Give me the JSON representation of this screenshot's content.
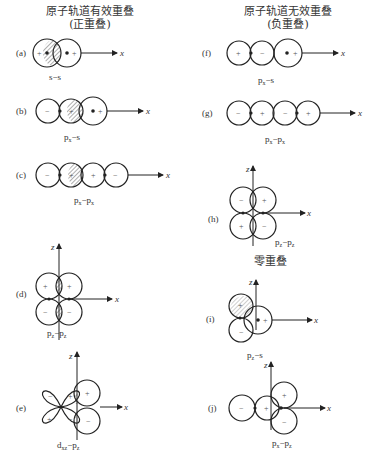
{
  "headings": {
    "left_title": "原子轨道有效重叠",
    "left_sub": "(正重叠)",
    "right_title": "原子轨道无效重叠",
    "right_sub": "(负重叠)",
    "zero_title": "零重叠"
  },
  "axis_labels": {
    "x": "x",
    "z": "z"
  },
  "signs": {
    "plus": "+",
    "minus": "−"
  },
  "panels": [
    {
      "id": "a",
      "label": "(a)",
      "caption": "s–s"
    },
    {
      "id": "b",
      "label": "(b)",
      "caption": "pₓ–s"
    },
    {
      "id": "c",
      "label": "(c)",
      "caption": "pₓ–pₓ"
    },
    {
      "id": "d",
      "label": "(d)",
      "caption": "p_z–p_z"
    },
    {
      "id": "e",
      "label": "(e)",
      "caption": "d_xz–p_z"
    },
    {
      "id": "f",
      "label": "(f)",
      "caption": "pₓ–s"
    },
    {
      "id": "g",
      "label": "(g)",
      "caption": "pₓ–pₓ"
    },
    {
      "id": "h",
      "label": "(h)",
      "caption": "p_z–p_z"
    },
    {
      "id": "i",
      "label": "(i)",
      "caption": "p_z–s"
    },
    {
      "id": "j",
      "label": "(j)",
      "caption": "pₓ–p_z"
    }
  ],
  "captions_rendered": {
    "a": "s−s",
    "b_main": "p",
    "b_sub": "x",
    "b_rest": "−s",
    "c_main": "p",
    "c_sub": "x",
    "c_rest": "−p",
    "c_sub2": "x",
    "d_main": "p",
    "d_sub": "z",
    "d_rest": "−p",
    "d_sub2": "z",
    "e_main": "d",
    "e_sub": "xz",
    "e_rest": "−p",
    "e_sub2": "z",
    "f_main": "p",
    "f_sub": "x",
    "f_rest": "−s",
    "g_main": "p",
    "g_sub": "x",
    "g_rest": "−p",
    "g_sub2": "x",
    "h_main": "p",
    "h_sub": "z",
    "h_rest": "−p",
    "h_sub2": "z",
    "i_main": "p",
    "i_sub": "z",
    "i_rest": "−s",
    "j_main": "p",
    "j_sub": "x",
    "j_rest": "−p",
    "j_sub2": "z"
  },
  "colors": {
    "line": "#222222",
    "text": "#333333",
    "background": "#ffffff"
  }
}
